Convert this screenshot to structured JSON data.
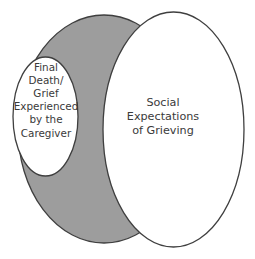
{
  "diagram": {
    "background_color": "#ffffff",
    "stroke_color": "#3f3f3f",
    "text_color": "#3a3a3a",
    "shapes": {
      "gray_ellipse": {
        "name": "gray-backdrop-ellipse",
        "fill": "#9d9d9d",
        "label": ""
      },
      "large_ellipse": {
        "name": "social-expectations-ellipse",
        "fill": "#ffffff",
        "label": "Social\nExpectations\nof Grieving"
      },
      "small_ellipse": {
        "name": "caregiver-grief-ellipse",
        "fill": "#ffffff",
        "label": "Final\nDeath/\nGrief\nExperienced\nby the\nCaregiver"
      }
    }
  }
}
